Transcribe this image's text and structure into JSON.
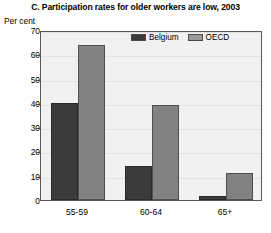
{
  "chart_data": {
    "type": "bar",
    "title": "C. Participation rates for older workers are low, 2003",
    "xlabel": "",
    "ylabel": "Per cent",
    "categories": [
      "55-59",
      "60-64",
      "65+"
    ],
    "series": [
      {
        "name": "Belgium",
        "values": [
          40,
          14,
          1.5
        ],
        "color": "#3b3b3b"
      },
      {
        "name": "OECD",
        "values": [
          64,
          39,
          11
        ],
        "color": "#828282"
      }
    ],
    "ylim": [
      0,
      70
    ],
    "yticks": [
      0,
      10,
      20,
      30,
      40,
      50,
      60,
      70
    ],
    "ytick_labels": [
      "0",
      "10",
      "20",
      "30",
      "40",
      "50",
      "60",
      "70"
    ],
    "grid": true,
    "legend_position": "top-right-inside"
  },
  "legend": {
    "entries": [
      {
        "label": "Belgium",
        "swatch": "dark-gray-swatch"
      },
      {
        "label": "OECD",
        "swatch": "light-gray-swatch"
      }
    ]
  }
}
